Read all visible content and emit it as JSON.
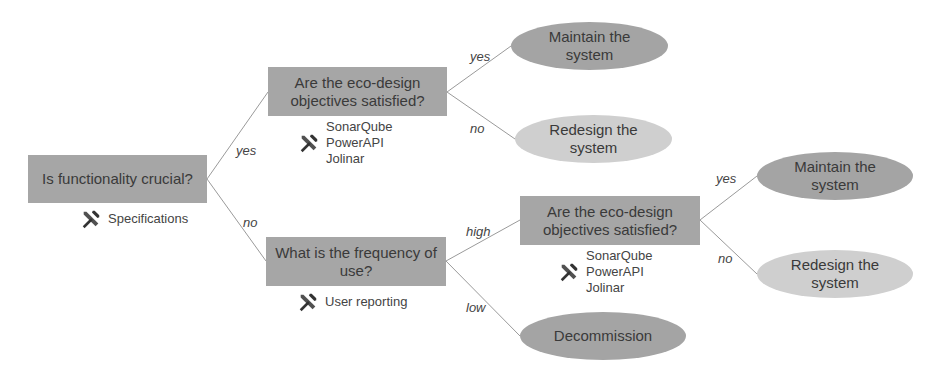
{
  "nodes": {
    "root": {
      "label": "Is functionality crucial?",
      "tools": [
        "Specifications"
      ]
    },
    "eco1": {
      "label": "Are the eco-design objectives satisfied?",
      "tools": [
        "SonarQube",
        "PowerAPI",
        "Jolinar"
      ]
    },
    "freq": {
      "label": "What is the frequency of use?",
      "tools": [
        "User reporting"
      ]
    },
    "eco2": {
      "label": "Are the eco-design objectives satisfied?",
      "tools": [
        "SonarQube",
        "PowerAPI",
        "Jolinar"
      ]
    },
    "maintain1": {
      "label": "Maintain the system"
    },
    "redesign1": {
      "label": "Redesign the system"
    },
    "maintain2": {
      "label": "Maintain the system"
    },
    "redesign2": {
      "label": "Redesign the system"
    },
    "decommission": {
      "label": "Decommission"
    }
  },
  "edges": {
    "root_eco1": "yes",
    "root_freq": "no",
    "eco1_maintain": "yes",
    "eco1_redesign": "no",
    "freq_eco2": "high",
    "freq_decom": "low",
    "eco2_maintain": "yes",
    "eco2_redesign": "no"
  },
  "colors": {
    "question_box": "#a6a6a6",
    "ellipse_dark": "#a4a4a4",
    "ellipse_light": "#cfcfcf",
    "edge": "#9a9a9a"
  }
}
